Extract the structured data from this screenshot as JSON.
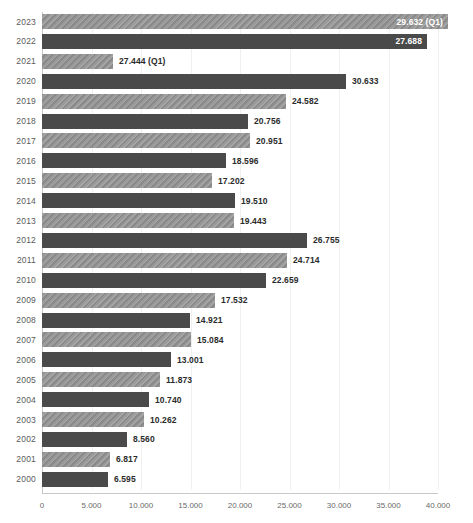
{
  "chart_data": {
    "type": "bar",
    "orientation": "horizontal",
    "title": "",
    "subtitle": "",
    "xlabel": "",
    "ylabel": "",
    "xlim": [
      0,
      40000
    ],
    "grid": true,
    "legend": "none",
    "xticks": [
      "0",
      "5.000",
      "10.000",
      "15.000",
      "20.000",
      "25.000",
      "30.000",
      "35.000",
      "40.000"
    ],
    "xtick_values": [
      0,
      5000,
      10000,
      15000,
      20000,
      25000,
      30000,
      35000,
      40000
    ],
    "categories": [
      "2023",
      "2022",
      "2021",
      "2020",
      "2019",
      "2018",
      "2017",
      "2016",
      "2015",
      "2014",
      "2013",
      "2012",
      "2011",
      "2010",
      "2009",
      "2008",
      "2007",
      "2006",
      "2005",
      "2004",
      "2003",
      "2002",
      "2001",
      "2000"
    ],
    "values": [
      29632,
      27688,
      27444,
      30633,
      24582,
      20756,
      20951,
      18596,
      17202,
      19510,
      19443,
      26755,
      24714,
      22659,
      17532,
      14921,
      15084,
      13001,
      11873,
      10740,
      10262,
      8560,
      6817,
      6595
    ],
    "bars": [
      {
        "category": "2023",
        "value": 29632,
        "label": "29.632 (Q1)",
        "style": "hatch",
        "label_position": "inside",
        "bar_end_px": 448
      },
      {
        "category": "2022",
        "value": 27688,
        "label": "27.688",
        "style": "solid",
        "label_position": "inside",
        "bar_end_px": 427
      },
      {
        "category": "2021",
        "value": 27444,
        "label": "27.444 (Q1)",
        "style": "hatch",
        "label_position": "outside",
        "bar_end_px": 113
      },
      {
        "category": "2020",
        "value": 30633,
        "label": "30.633",
        "style": "solid",
        "label_position": "outside",
        "bar_end_px": 346
      },
      {
        "category": "2019",
        "value": 24582,
        "label": "24.582",
        "style": "hatch",
        "label_position": "outside",
        "bar_end_px": 286
      },
      {
        "category": "2018",
        "value": 20756,
        "label": "20.756",
        "style": "solid",
        "label_position": "outside",
        "bar_end_px": 248
      },
      {
        "category": "2017",
        "value": 20951,
        "label": "20.951",
        "style": "hatch",
        "label_position": "outside",
        "bar_end_px": 250
      },
      {
        "category": "2016",
        "value": 18596,
        "label": "18.596",
        "style": "solid",
        "label_position": "outside",
        "bar_end_px": 226
      },
      {
        "category": "2015",
        "value": 17202,
        "label": "17.202",
        "style": "hatch",
        "label_position": "outside",
        "bar_end_px": 212
      },
      {
        "category": "2014",
        "value": 19510,
        "label": "19.510",
        "style": "solid",
        "label_position": "outside",
        "bar_end_px": 235
      },
      {
        "category": "2013",
        "value": 19443,
        "label": "19.443",
        "style": "hatch",
        "label_position": "outside",
        "bar_end_px": 234
      },
      {
        "category": "2012",
        "value": 26755,
        "label": "26.755",
        "style": "solid",
        "label_position": "outside",
        "bar_end_px": 307
      },
      {
        "category": "2011",
        "value": 24714,
        "label": "24.714",
        "style": "hatch",
        "label_position": "outside",
        "bar_end_px": 287
      },
      {
        "category": "2010",
        "value": 22659,
        "label": "22.659",
        "style": "solid",
        "label_position": "outside",
        "bar_end_px": 266
      },
      {
        "category": "2009",
        "value": 17532,
        "label": "17.532",
        "style": "hatch",
        "label_position": "outside",
        "bar_end_px": 215
      },
      {
        "category": "2008",
        "value": 14921,
        "label": "14.921",
        "style": "solid",
        "label_position": "outside",
        "bar_end_px": 190
      },
      {
        "category": "2007",
        "value": 15084,
        "label": "15.084",
        "style": "hatch",
        "label_position": "outside",
        "bar_end_px": 191
      },
      {
        "category": "2006",
        "value": 13001,
        "label": "13.001",
        "style": "solid",
        "label_position": "outside",
        "bar_end_px": 171
      },
      {
        "category": "2005",
        "value": 11873,
        "label": "11.873",
        "style": "hatch",
        "label_position": "outside",
        "bar_end_px": 160
      },
      {
        "category": "2004",
        "value": 10740,
        "label": "10.740",
        "style": "solid",
        "label_position": "outside",
        "bar_end_px": 149
      },
      {
        "category": "2003",
        "value": 10262,
        "label": "10.262",
        "style": "hatch",
        "label_position": "outside",
        "bar_end_px": 144
      },
      {
        "category": "2002",
        "value": 8560,
        "label": "8.560",
        "style": "solid",
        "label_position": "outside",
        "bar_end_px": 127
      },
      {
        "category": "2001",
        "value": 6817,
        "label": "6.817",
        "style": "hatch",
        "label_position": "outside",
        "bar_end_px": 110
      },
      {
        "category": "2000",
        "value": 6595,
        "label": "6.595",
        "style": "solid",
        "label_position": "outside",
        "bar_end_px": 108
      }
    ],
    "colors": {
      "bar_solid": "#4a4a4a",
      "bar_hatch": "#8a8a8a",
      "label_outside": "#2b2b2b",
      "label_inside": "#ffffff",
      "axis": "#c9c9c9",
      "grid": "#f0f0f0",
      "tick_text": "#6a6a6a",
      "category_text": "#5b5b5b",
      "background": "#ffffff"
    }
  }
}
